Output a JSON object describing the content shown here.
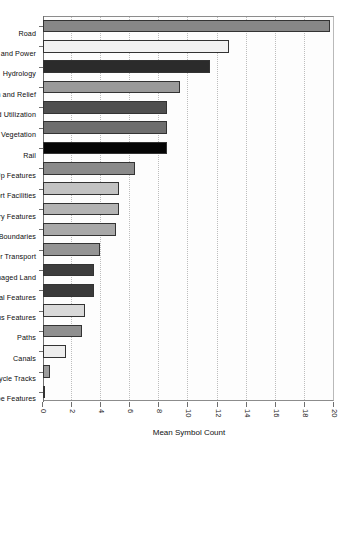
{
  "chart": {
    "type": "bar",
    "title": "",
    "value_axis_title": "Mean Symbol Count",
    "category_axis_title": ""
  },
  "chart_data": {
    "type": "bar",
    "title": "",
    "subtitle": "",
    "xlabel": "",
    "ylabel": "Mean Symbol Count",
    "ylim": [
      0,
      20
    ],
    "yticks": [
      0,
      2,
      4,
      6,
      8,
      10,
      12,
      14,
      16,
      18,
      20
    ],
    "ytick_labels": [
      "0",
      "2",
      "4",
      "6",
      "8",
      "10",
      "12",
      "14",
      "16",
      "18",
      "20"
    ],
    "grid": "horizontal-dotted",
    "legend": "none",
    "orientation": "vertical-bars-figure-rotated-90deg",
    "categories": [
      "Road",
      "Industry, Communications, and Power",
      "Hydrology",
      "Terrain and Relief",
      "Water Management and Utilization",
      "Vegetation",
      "Rail",
      "General Built-Up Features",
      "Tourist and Sport Facilities",
      "Navigation and Military Features",
      "Administrative Boundaries",
      "Other Transport",
      "Managed Land",
      "Historical Features",
      "Religious Features",
      "Paths",
      "Canals",
      "Cycle Tracks",
      "Non-Landscape Features"
    ],
    "values": [
      19.7,
      12.8,
      11.5,
      9.4,
      8.5,
      8.5,
      8.5,
      6.3,
      5.2,
      5.2,
      5.0,
      3.9,
      3.5,
      3.5,
      2.9,
      2.7,
      1.6,
      0.5,
      0.1
    ],
    "bar_colors": [
      "#878787",
      "#f2f2f2",
      "#2b2b2b",
      "#9a9a9a",
      "#4f4f4f",
      "#6e6e6e",
      "#050505",
      "#8a8a8a",
      "#c2c2c2",
      "#b3b3b3",
      "#a8a8a8",
      "#949494",
      "#3d3d3d",
      "#3a3a3a",
      "#d9d9d9",
      "#8f8f8f",
      "#ededed",
      "#9c9c9c",
      "#d2d2d2"
    ]
  },
  "colors": {
    "axis": "#6f6f6f",
    "gridline": "#bdbdbd",
    "bar_outline": "#333333",
    "text": "#111111",
    "plot_background": "#fdfdfd",
    "page_background": "#ffffff"
  }
}
